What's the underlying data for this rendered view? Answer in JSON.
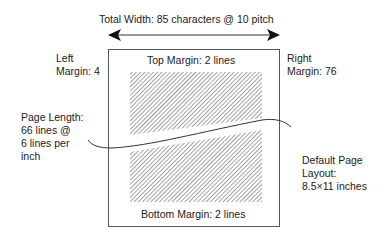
{
  "diagram": {
    "total_width_label": "Total Width: 85 characters @ 10 pitch",
    "left_margin": {
      "line1": "Left",
      "line2": "Margin: 4"
    },
    "right_margin": {
      "line1": "Right",
      "line2": "Margin: 76"
    },
    "top_margin_label": "Top Margin: 2 lines",
    "bottom_margin_label": "Bottom Margin: 2 lines",
    "page_length": {
      "line1": "Page Length:",
      "line2": "66 lines @",
      "line3": "6 lines per",
      "line4": "inch"
    },
    "default_layout": {
      "line1": "Default Page",
      "line2": "Layout:",
      "line3": "8.5×11 inches"
    },
    "colors": {
      "line": "#333333",
      "hatch": "#555555",
      "background": "#ffffff"
    }
  }
}
